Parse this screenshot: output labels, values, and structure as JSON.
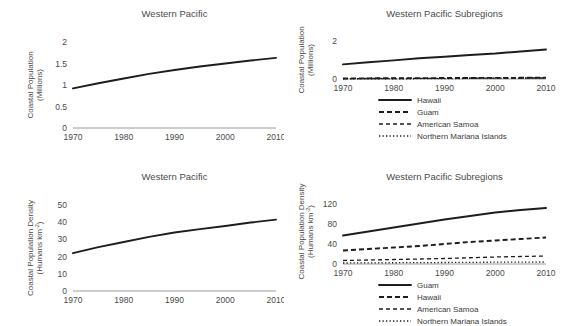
{
  "figure": {
    "background": "#ffffff",
    "ink": "#1d1d1d",
    "axis_color": "#9b9b9b"
  },
  "panels": [
    {
      "id": "top-left",
      "title": "Western Pacific",
      "ylabel_line1": "Coastal Population",
      "ylabel_line2": "(Millions)"
    },
    {
      "id": "top-right",
      "title": "Western Pacific Subregions",
      "ylabel_line1": "Coastal Population",
      "ylabel_line2": "(Millions)"
    },
    {
      "id": "bottom-left",
      "title": "Western Pacific",
      "ylabel_line1": "Coastal Population Density",
      "ylabel_line2": "(Humans km",
      "ylabel_sup": "-2",
      "ylabel_line2_end": ")"
    },
    {
      "id": "bottom-right",
      "title": "Western Pacific Subregions",
      "ylabel_line1": "Coastal Population Density",
      "ylabel_line2": "(Humans km",
      "ylabel_sup": "-2",
      "ylabel_line2_end": ")"
    }
  ],
  "chart_data": [
    {
      "id": "top-left",
      "type": "line",
      "title": "Western Pacific",
      "xlabel": "",
      "ylabel": "Coastal Population (Millions)",
      "x": [
        1970,
        1975,
        1980,
        1985,
        1990,
        1995,
        2000,
        2005,
        2010
      ],
      "xticks": [
        1970,
        1980,
        1990,
        2000,
        2010
      ],
      "xlim": [
        1970,
        2010
      ],
      "yticks": [
        0,
        0.5,
        1,
        1.5,
        2
      ],
      "ytick_labels": [
        "0",
        "0.5",
        "1",
        "1.5",
        "2"
      ],
      "ylim": [
        0,
        2
      ],
      "grid": false,
      "legend": null,
      "series": [
        {
          "name": "Western Pacific",
          "style": "solid",
          "values": [
            0.92,
            1.04,
            1.15,
            1.26,
            1.35,
            1.43,
            1.5,
            1.57,
            1.63
          ]
        }
      ]
    },
    {
      "id": "top-right",
      "type": "line",
      "title": "Western Pacific Subregions",
      "xlabel": "",
      "ylabel": "Coastal Population (Millions)",
      "x": [
        1970,
        1975,
        1980,
        1985,
        1990,
        1995,
        2000,
        2005,
        2010
      ],
      "xticks": [
        1970,
        1980,
        1990,
        2000,
        2010
      ],
      "xlim": [
        1970,
        2010
      ],
      "yticks": [
        0,
        2
      ],
      "ytick_labels": [
        "0",
        "2"
      ],
      "ylim": [
        0,
        2
      ],
      "grid": false,
      "legend": "below-axis",
      "series": [
        {
          "name": "Hawaii",
          "style": "solid",
          "values": [
            0.77,
            0.88,
            0.98,
            1.09,
            1.17,
            1.26,
            1.34,
            1.45,
            1.55
          ]
        },
        {
          "name": "Guam",
          "style": "dashed-thick",
          "values": [
            0.03,
            0.035,
            0.04,
            0.045,
            0.05,
            0.055,
            0.06,
            0.062,
            0.065
          ]
        },
        {
          "name": "American Samoa",
          "style": "dashed-thin",
          "values": [
            0.022,
            0.026,
            0.03,
            0.034,
            0.038,
            0.042,
            0.046,
            0.05,
            0.054
          ]
        },
        {
          "name": "Northern Mariana Islands",
          "style": "dotted",
          "values": [
            0.01,
            0.011,
            0.013,
            0.015,
            0.02,
            0.03,
            0.04,
            0.045,
            0.048
          ]
        }
      ]
    },
    {
      "id": "bottom-left",
      "type": "line",
      "title": "Western Pacific",
      "xlabel": "",
      "ylabel": "Coastal Population Density (Humans km-2)",
      "x": [
        1970,
        1975,
        1980,
        1985,
        1990,
        1995,
        2000,
        2005,
        2010
      ],
      "xticks": [
        1970,
        1980,
        1990,
        2000,
        2010
      ],
      "xlim": [
        1970,
        2010
      ],
      "yticks": [
        0,
        10,
        20,
        30,
        40,
        50
      ],
      "ytick_labels": [
        "0",
        "10",
        "20",
        "30",
        "40",
        "50"
      ],
      "ylim": [
        0,
        50
      ],
      "grid": false,
      "legend": null,
      "series": [
        {
          "name": "Western Pacific",
          "style": "solid",
          "values": [
            22,
            25.5,
            28.5,
            31.5,
            34,
            36,
            37.8,
            39.8,
            41.5
          ]
        }
      ]
    },
    {
      "id": "bottom-right",
      "type": "line",
      "title": "Western Pacific Subregions",
      "xlabel": "",
      "ylabel": "Coastal Population Density (Humans km-2)",
      "x": [
        1970,
        1975,
        1980,
        1985,
        1990,
        1995,
        2000,
        2005,
        2010
      ],
      "xticks": [
        1970,
        1980,
        1990,
        2000,
        2010
      ],
      "xlim": [
        1970,
        2010
      ],
      "yticks": [
        0,
        40,
        80,
        120
      ],
      "ytick_labels": [
        "0",
        "40",
        "80",
        "120"
      ],
      "ylim": [
        0,
        130
      ],
      "grid": false,
      "legend": "below-axis",
      "series": [
        {
          "name": "Guam",
          "style": "solid",
          "values": [
            57,
            65,
            73,
            81,
            89,
            96,
            103,
            108,
            112
          ]
        },
        {
          "name": "Hawaii",
          "style": "dashed-thick",
          "values": [
            27,
            30,
            33,
            36,
            40,
            44,
            47,
            50,
            53
          ]
        },
        {
          "name": "American Samoa",
          "style": "dashed-thin",
          "values": [
            7,
            8,
            9,
            10,
            11,
            12.5,
            14,
            15,
            16
          ]
        },
        {
          "name": "Northern Mariana Islands",
          "style": "dotted",
          "values": [
            2,
            2.2,
            2.5,
            2.8,
            3,
            3.3,
            3.6,
            3.8,
            4
          ]
        }
      ]
    }
  ]
}
